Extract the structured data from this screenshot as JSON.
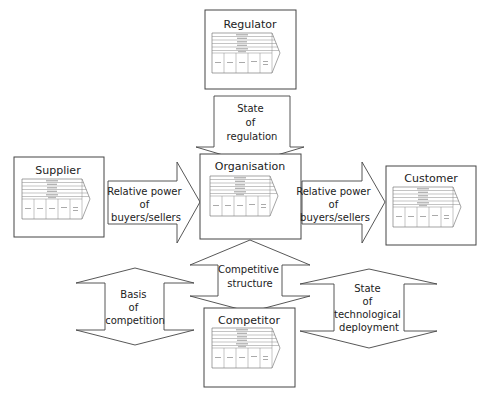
{
  "diagram": {
    "entities": {
      "regulator": {
        "title": "Regulator"
      },
      "supplier": {
        "title": "Supplier"
      },
      "organisation": {
        "title": "Organisation"
      },
      "customer": {
        "title": "Customer"
      },
      "competitor": {
        "title": "Competitor"
      }
    },
    "arrows": {
      "regulation": {
        "lines": [
          "State",
          "of",
          "regulation"
        ]
      },
      "supplier_power": {
        "lines": [
          "Relative power",
          "of",
          "buyers/sellers"
        ]
      },
      "customer_power": {
        "lines": [
          "Relative power",
          "of",
          "buyers/sellers"
        ]
      },
      "competitive_structure": {
        "lines": [
          "Competitive",
          "structure"
        ]
      },
      "basis_competition": {
        "lines": [
          "Basis",
          "of",
          "competition"
        ]
      },
      "tech_deployment": {
        "lines": [
          "State",
          "of",
          "technological",
          "deployment"
        ]
      }
    },
    "colors": {
      "stroke": "#444444",
      "background": "#ffffff",
      "text": "#222222"
    }
  }
}
